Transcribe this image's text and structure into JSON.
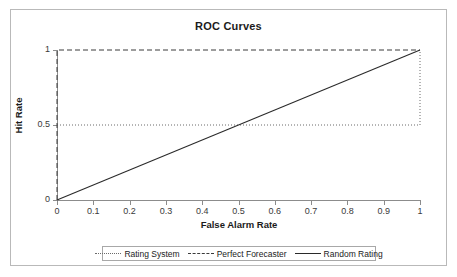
{
  "chart_data": {
    "type": "line",
    "title": "ROC Curves",
    "xlabel": "False Alarm Rate",
    "ylabel": "Hit Rate",
    "xlim": [
      0,
      1
    ],
    "ylim": [
      0,
      1
    ],
    "grid": false,
    "legend_position": "bottom",
    "x_ticks": [
      "0",
      "0.1",
      "0.2",
      "0.3",
      "0.4",
      "0.5",
      "0.6",
      "0.7",
      "0.8",
      "0.9",
      "1"
    ],
    "x_tick_values": [
      0,
      0.1,
      0.2,
      0.3,
      0.4,
      0.5,
      0.6,
      0.7,
      0.8,
      0.9,
      1
    ],
    "y_ticks": [
      "0",
      "0.5",
      "1"
    ],
    "y_tick_values": [
      0,
      0.5,
      1
    ],
    "series": [
      {
        "name": "Rating System",
        "style": "dotted",
        "color": "#6b6b6b",
        "x": [
          0,
          1,
          1
        ],
        "y": [
          0.5,
          0.5,
          1
        ]
      },
      {
        "name": "Perfect Forecaster",
        "style": "dashed",
        "color": "#3a3a3a",
        "x": [
          0,
          0,
          1
        ],
        "y": [
          0,
          1,
          1
        ]
      },
      {
        "name": "Random Rating",
        "style": "solid",
        "color": "#2a2a2a",
        "x": [
          0,
          1
        ],
        "y": [
          0,
          1
        ]
      }
    ]
  },
  "legend": {
    "entries": [
      {
        "label": "Rating System"
      },
      {
        "label": "Perfect Forecaster"
      },
      {
        "label": "Random Rating"
      }
    ]
  }
}
